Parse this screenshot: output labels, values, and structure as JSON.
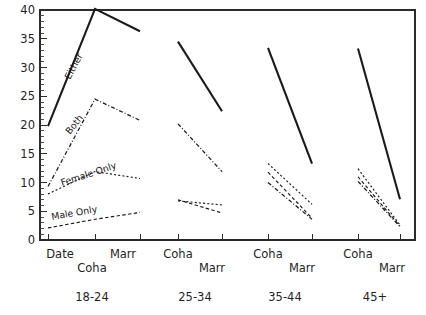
{
  "chart_data": {
    "type": "line",
    "title": "",
    "subtitle": "",
    "xlabel": "",
    "ylabel": "",
    "ylim": [
      0,
      40
    ],
    "yticks": [
      0,
      5,
      10,
      15,
      20,
      25,
      30,
      35,
      40
    ],
    "ytick_labels": [
      "0",
      "5",
      "10",
      "15",
      "20",
      "25",
      "30",
      "35",
      "40"
    ],
    "y_minor_tick_step": 1,
    "grid": false,
    "legend_position": "inline-labels",
    "x_axis_note": "Four age-group panels; within each panel the relationship-status categories are plotted left to right",
    "groups": [
      {
        "label": "18-24",
        "x_categories": [
          "Date",
          "Coha",
          "Marr"
        ]
      },
      {
        "label": "25-34",
        "x_categories": [
          "Coha",
          "Marr"
        ]
      },
      {
        "label": "35-44",
        "x_categories": [
          "Coha",
          "Marr"
        ]
      },
      {
        "label": "45+",
        "x_categories": [
          "Coha",
          "Marr"
        ]
      }
    ],
    "series": [
      {
        "name": "Either",
        "style": "solid",
        "inline_label": "Either",
        "values_by_group": {
          "18-24": [
            19.8,
            40.2,
            36.3
          ],
          "25-34": [
            34.5,
            22.4
          ],
          "35-44": [
            33.4,
            13.3
          ],
          "45+": [
            33.3,
            7.1
          ]
        }
      },
      {
        "name": "Both",
        "style": "dash-dot",
        "inline_label": "Both",
        "values_by_group": {
          "18-24": [
            9.3,
            24.5,
            20.8
          ],
          "25-34": [
            20.2,
            11.9
          ],
          "35-44": [
            10.0,
            3.6
          ],
          "45+": [
            10.2,
            2.3
          ]
        }
      },
      {
        "name": "Female Only",
        "style": "dotted",
        "inline_label": "Female Only",
        "values_by_group": {
          "18-24": [
            8.0,
            11.9,
            10.7
          ],
          "25-34": [
            6.8,
            6.1
          ],
          "35-44": [
            13.3,
            6.2
          ],
          "45+": [
            12.4,
            2.6
          ]
        }
      },
      {
        "name": "Male Only",
        "style": "dashed",
        "inline_label": "Male Only",
        "values_by_group": {
          "18-24": [
            2.1,
            3.6,
            4.8
          ],
          "25-34": [
            7.0,
            4.7
          ],
          "35-44": [
            11.8,
            3.8
          ],
          "45+": [
            11.0,
            2.4
          ]
        }
      }
    ],
    "x_tick_labels_row1": [
      "Date",
      "Marr",
      "Coha",
      "Coha",
      "Coha"
    ],
    "x_tick_labels_row2": [
      "Coha",
      "Marr",
      "Marr",
      "Marr"
    ],
    "group_labels": [
      "18-24",
      "25-34",
      "35-44",
      "45+"
    ]
  },
  "axis": {
    "y_tick_labels": [
      "40",
      "35",
      "30",
      "25",
      "20",
      "15",
      "10",
      "5",
      "0"
    ],
    "x_labels_upper": [
      {
        "text": "Date",
        "x": 60
      },
      {
        "text": "Marr",
        "x": 123
      },
      {
        "text": "Coha",
        "x": 178
      },
      {
        "text": "Coha",
        "x": 268
      },
      {
        "text": "Coha",
        "x": 358
      }
    ],
    "x_labels_lower": [
      {
        "text": "Coha",
        "x": 92
      },
      {
        "text": "Marr",
        "x": 212
      },
      {
        "text": "Marr",
        "x": 302
      },
      {
        "text": "Marr",
        "x": 392
      }
    ],
    "group_labels": [
      {
        "text": "18-24",
        "x": 92
      },
      {
        "text": "25-34",
        "x": 195
      },
      {
        "text": "35-44",
        "x": 285
      },
      {
        "text": "45+",
        "x": 375
      }
    ]
  },
  "inline_labels": [
    {
      "name": "either",
      "text": "Either",
      "x": 70,
      "y": 80,
      "rotate": -62
    },
    {
      "name": "both",
      "text": "Both",
      "x": 70,
      "y": 135,
      "rotate": -52
    },
    {
      "name": "female-only",
      "text": "Female Only",
      "x": 62,
      "y": 186,
      "rotate": -18
    },
    {
      "name": "male-only",
      "text": "Male Only",
      "x": 52,
      "y": 220,
      "rotate": -10
    }
  ],
  "colors": {
    "ink": "#1a1a1a",
    "axis": "#2b2b2b",
    "background": "#ffffff"
  }
}
